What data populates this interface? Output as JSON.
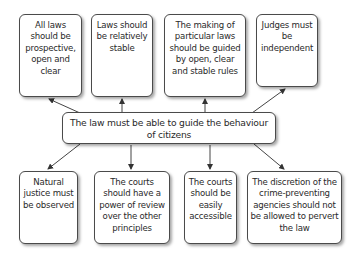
{
  "diagram": {
    "center": {
      "label": "The law must be able to guide the behaviour of citizens"
    },
    "top_nodes": [
      {
        "label": "All laws should be prospective, open and clear"
      },
      {
        "label": "Laws should be relatively stable"
      },
      {
        "label": "The making of particular laws should be guided by open, clear and stable rules"
      },
      {
        "label": "Judges must be independent"
      }
    ],
    "bottom_nodes": [
      {
        "label": "Natural justice must be observed"
      },
      {
        "label": "The courts should have a power of review over the other principles"
      },
      {
        "label": "The courts should be easily accessible"
      },
      {
        "label": "The discretion of the crime-preventing agencies should not be allowed to pervert the law"
      }
    ],
    "edges": [
      {
        "from": "center",
        "to": "top_nodes.0"
      },
      {
        "from": "center",
        "to": "top_nodes.1"
      },
      {
        "from": "center",
        "to": "top_nodes.2"
      },
      {
        "from": "center",
        "to": "top_nodes.3"
      },
      {
        "from": "center",
        "to": "bottom_nodes.0"
      },
      {
        "from": "center",
        "to": "bottom_nodes.1"
      },
      {
        "from": "center",
        "to": "bottom_nodes.2"
      },
      {
        "from": "center",
        "to": "bottom_nodes.3"
      }
    ]
  }
}
